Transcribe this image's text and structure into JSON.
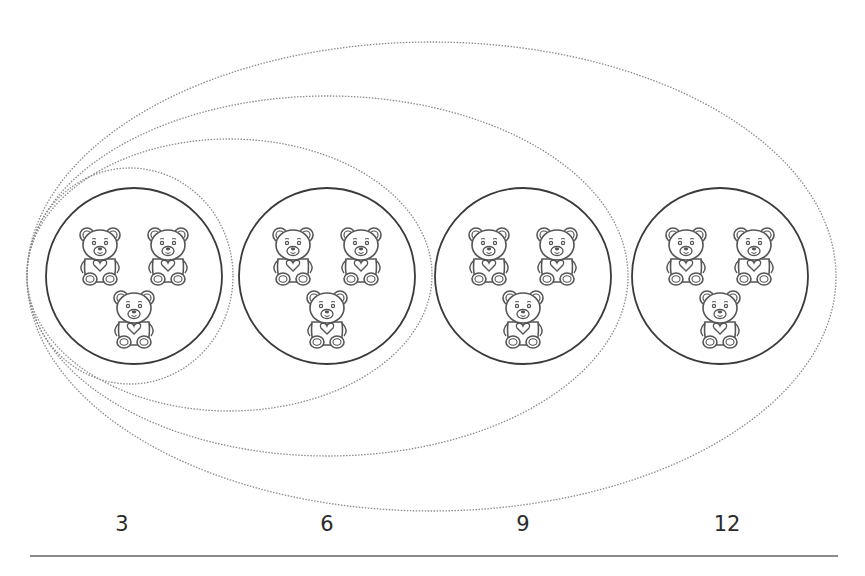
{
  "groups": [
    {
      "bears": 3,
      "cumulative_label": "3"
    },
    {
      "bears": 3,
      "cumulative_label": "6"
    },
    {
      "bears": 3,
      "cumulative_label": "9"
    },
    {
      "bears": 3,
      "cumulative_label": "12"
    }
  ],
  "bear_icon": "teddy-bear-with-heart-icon",
  "colors": {
    "circle_stroke": "#3a3a3a",
    "ellipse_stroke": "#8c8c8c",
    "bear_stroke": "#555555",
    "label_text": "#2a2a2a",
    "baseline": "#8a8a8a"
  }
}
